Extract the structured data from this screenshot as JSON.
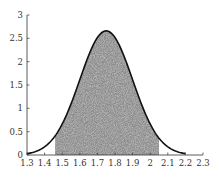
{
  "chart_data": {
    "type": "area",
    "title": "",
    "xlabel": "",
    "ylabel": "",
    "xlim": [
      1.3,
      2.3
    ],
    "ylim": [
      0,
      3
    ],
    "grid": false,
    "legend": null,
    "x_ticks": [
      "1.3",
      "1.4",
      "1.5",
      "1.6",
      "1.7",
      "1.8",
      "1.9",
      "2",
      "2.1",
      "2.2",
      "2.3"
    ],
    "y_ticks": [
      "0",
      "0.5",
      "1",
      "1.5",
      "2",
      "2.5",
      "3"
    ],
    "curve": {
      "kind": "normal-density",
      "mean": 1.75,
      "std": 0.15,
      "x_range": [
        1.3,
        2.2
      ],
      "color": "#111111"
    },
    "shaded_region": {
      "x_range": [
        1.46,
        2.05
      ],
      "fill": "stippled-gray",
      "color": "#8a8a8a"
    },
    "peak": {
      "x": 1.75,
      "y": 2.66
    }
  }
}
